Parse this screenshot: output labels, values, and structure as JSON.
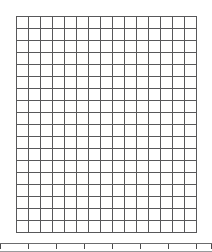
{
  "artwork": {
    "title": "Sunflower pixel art grid",
    "grid": {
      "columns": 15,
      "rows": 18,
      "cell_size_px": 12,
      "gridline_color": "#58585a"
    },
    "palette": {
      "white": "#ffffff",
      "petal_yellow": "#f3e84f",
      "seed_dark_brown": "#6b4423",
      "seed_tan": "#d2b489"
    },
    "legend": {
      "w": "white",
      "y": "petal_yellow",
      "d": "seed_dark_brown",
      "t": "seed_tan"
    },
    "pixels": [
      "wwwwwwwwwwwwwww",
      "wwwwwwyywyywwww",
      "wwwwyyyyyyywwww",
      "wwwyyyyyyyyyyww",
      "wwyyyydtdtdyyyw",
      "wyyyydtdtdtyyyw",
      "wyyydtdtdtdyyyy",
      "yyyytdtdtdtdyyy",
      "yyydtdtdtdtdyyy",
      "wyyytdtdtdtdyyy",
      "wyyydtdtdtdtyyw",
      "wyyytdtdtdtdyyw",
      "wwyyydtdtdtyyww",
      "wwyyyytdtdwyyww",
      "wwwyyyyyyyyyyww",
      "wwwwyyywyywyyww",
      "wwwwwwyyywwwwww",
      "wwwwwwwwwwwwwww"
    ]
  },
  "ruler": {
    "label": "bottom-scale-strip",
    "tick_positions_px": [
      0,
      28,
      56,
      84,
      112,
      140,
      168,
      196,
      211
    ]
  }
}
